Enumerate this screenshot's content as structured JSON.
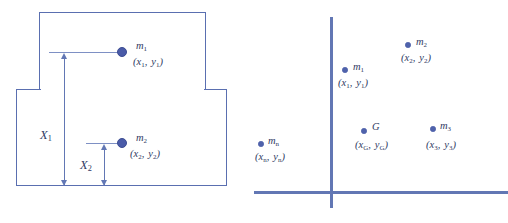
{
  "figure": {
    "colors": {
      "line": "#6277b4",
      "rect_border": "#5a6fb0",
      "marker": "#4a5ba8",
      "text": "#2f3a63",
      "background": "#ffffff"
    }
  },
  "left_panel": {
    "name": "composite-body-elevation",
    "bodies": [
      {
        "id": "upper-block",
        "label": ""
      },
      {
        "id": "lower-block",
        "label": ""
      }
    ],
    "masses": [
      {
        "id": "m1",
        "symbol": "m",
        "subscript": "1",
        "coord_x": "x",
        "coord_x_sub": "1",
        "coord_y": "y",
        "coord_y_sub": "1"
      },
      {
        "id": "m2",
        "symbol": "m",
        "subscript": "2",
        "coord_x": "x",
        "coord_x_sub": "2",
        "coord_y": "y",
        "coord_y_sub": "2"
      }
    ],
    "dimensions": [
      {
        "id": "X1",
        "symbol": "X",
        "subscript": "1"
      },
      {
        "id": "X2",
        "symbol": "X",
        "subscript": "2"
      }
    ]
  },
  "right_panel": {
    "name": "discrete-mass-coordinate-plot",
    "axes": {
      "vertical_label": "",
      "horizontal_label": ""
    },
    "points": [
      {
        "id": "mn",
        "symbol": "m",
        "subscript": "n",
        "coord_x": "x",
        "coord_x_sub": "n",
        "coord_y": "y",
        "coord_y_sub": "n"
      },
      {
        "id": "m1",
        "symbol": "m",
        "subscript": "1",
        "coord_x": "x",
        "coord_x_sub": "1",
        "coord_y": "y",
        "coord_y_sub": "1"
      },
      {
        "id": "m2",
        "symbol": "m",
        "subscript": "2",
        "coord_x": "x",
        "coord_x_sub": "2",
        "coord_y": "y",
        "coord_y_sub": "2"
      },
      {
        "id": "m3",
        "symbol": "m",
        "subscript": "3",
        "coord_x": "x",
        "coord_x_sub": "3",
        "coord_y": "y",
        "coord_y_sub": "3"
      },
      {
        "id": "G",
        "symbol": "G",
        "subscript": "",
        "coord_x": "x",
        "coord_x_sub": "G",
        "coord_y": "y",
        "coord_y_sub": "G"
      }
    ]
  }
}
